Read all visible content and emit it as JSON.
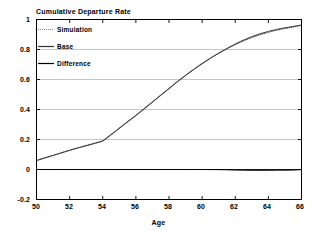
{
  "chart_data": {
    "type": "line",
    "title": "Cumulative Departure Rate",
    "xlabel": "Age",
    "ylabel": "",
    "xlim": [
      50,
      66
    ],
    "ylim": [
      -0.2,
      1.0
    ],
    "xticks": [
      "50",
      "52",
      "54",
      "56",
      "58",
      "60",
      "62",
      "64",
      "66"
    ],
    "xtick_values": [
      50,
      52,
      54,
      56,
      58,
      60,
      62,
      64,
      66
    ],
    "yticks": [
      "1",
      "0.8",
      "0.6",
      "0.4",
      "0.2",
      "0",
      "-0.2"
    ],
    "ytick_values": [
      1,
      0.8,
      0.6,
      0.4,
      0.2,
      0,
      -0.2
    ],
    "grid": "horizontal",
    "legend_position": "upper-left-inside",
    "zero_line": 0,
    "series": [
      {
        "name": "Simulation",
        "style": "dotted",
        "color": "#555555",
        "x": [
          50,
          50.5,
          51,
          51.5,
          52,
          52.5,
          53,
          53.5,
          54,
          54.5,
          55,
          55.5,
          56,
          56.5,
          57,
          57.5,
          58,
          58.5,
          59,
          59.5,
          60,
          60.5,
          61,
          61.5,
          62,
          62.5,
          63,
          63.5,
          64,
          64.5,
          65,
          65.5,
          66
        ],
        "values": [
          0.06,
          0.077,
          0.094,
          0.111,
          0.128,
          0.144,
          0.159,
          0.174,
          0.19,
          0.232,
          0.275,
          0.318,
          0.36,
          0.405,
          0.45,
          0.495,
          0.54,
          0.585,
          0.627,
          0.668,
          0.706,
          0.742,
          0.775,
          0.805,
          0.833,
          0.858,
          0.88,
          0.899,
          0.915,
          0.929,
          0.94,
          0.95,
          0.962
        ]
      },
      {
        "name": "Base",
        "style": "solid",
        "color": "#333333",
        "x": [
          50,
          50.5,
          51,
          51.5,
          52,
          52.5,
          53,
          53.5,
          54,
          54.5,
          55,
          55.5,
          56,
          56.5,
          57,
          57.5,
          58,
          58.5,
          59,
          59.5,
          60,
          60.5,
          61,
          61.5,
          62,
          62.5,
          63,
          63.5,
          64,
          64.5,
          65,
          65.5,
          66
        ],
        "values": [
          0.06,
          0.077,
          0.094,
          0.111,
          0.128,
          0.144,
          0.159,
          0.174,
          0.19,
          0.232,
          0.275,
          0.318,
          0.36,
          0.405,
          0.45,
          0.495,
          0.54,
          0.585,
          0.627,
          0.668,
          0.706,
          0.742,
          0.776,
          0.807,
          0.837,
          0.863,
          0.886,
          0.905,
          0.921,
          0.934,
          0.945,
          0.954,
          0.963
        ]
      },
      {
        "name": "Difference",
        "style": "solid",
        "color": "#000000",
        "x": [
          50,
          51,
          52,
          53,
          54,
          55,
          56,
          57,
          58,
          59,
          60,
          61,
          61.5,
          62,
          62.5,
          63,
          63.5,
          64,
          64.5,
          65,
          65.5,
          66
        ],
        "values": [
          0.0,
          0.0,
          0.0,
          0.0,
          0.0,
          0.0,
          0.0,
          0.0,
          0.0,
          0.0,
          0.0,
          -0.001,
          -0.002,
          -0.004,
          -0.005,
          -0.006,
          -0.006,
          -0.006,
          -0.005,
          -0.005,
          -0.004,
          -0.001
        ]
      }
    ]
  },
  "legend": {
    "items": [
      {
        "label": "Simulation"
      },
      {
        "label": "Base"
      },
      {
        "label": "Difference"
      }
    ]
  },
  "colors": {
    "frame": "#000000",
    "grid": "#b8b8b8",
    "zero_line": "#1a1a1a",
    "background": "#ffffff"
  }
}
